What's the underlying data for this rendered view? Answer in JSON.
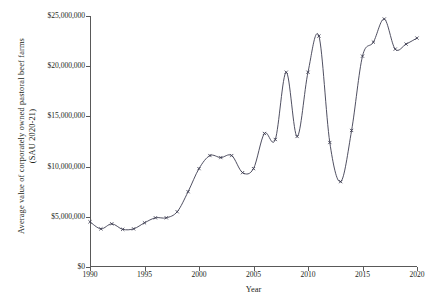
{
  "chart_data": {
    "type": "line",
    "title": "",
    "xlabel": "Year",
    "ylabel": "Average value of corporately owned pastoral beef farms (SAU 2020-21)",
    "ylabel_line1": "Average value of corporately owned pastoral beef farms",
    "ylabel_line2": "(SAU 2020-21)",
    "xlim": [
      1990,
      2020
    ],
    "ylim": [
      0,
      25000000
    ],
    "grid": false,
    "legend": "none",
    "marker": "x",
    "line_color": "#3b3b4f",
    "x": [
      1990,
      1991,
      1992,
      1993,
      1994,
      1995,
      1996,
      1997,
      1998,
      1999,
      2000,
      2001,
      2002,
      2003,
      2004,
      2005,
      2006,
      2007,
      2008,
      2009,
      2010,
      2011,
      2012,
      2013,
      2014,
      2015,
      2016,
      2017,
      2018,
      2019,
      2020
    ],
    "values": [
      4500000,
      3800000,
      4300000,
      3750000,
      3800000,
      4400000,
      4900000,
      4900000,
      5500000,
      7500000,
      9800000,
      11100000,
      10900000,
      11100000,
      9400000,
      9800000,
      13300000,
      12700000,
      19400000,
      13000000,
      19400000,
      23000000,
      12400000,
      8500000,
      13600000,
      21000000,
      22400000,
      24700000,
      21700000,
      22200000,
      22800000
    ],
    "xticks": [
      1990,
      1995,
      2000,
      2005,
      2010,
      2015,
      2020
    ],
    "xtick_labels": [
      "1990",
      "1995",
      "2000",
      "2005",
      "2010",
      "2015",
      "2020"
    ],
    "yticks": [
      0,
      5000000,
      10000000,
      15000000,
      20000000,
      25000000
    ],
    "ytick_labels": [
      "$0",
      "$5,000,000",
      "$10,000,000",
      "$15,000,000",
      "$20,000,000",
      "$25,000,000"
    ]
  }
}
